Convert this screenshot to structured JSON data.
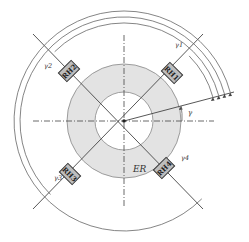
{
  "diagram": {
    "colors": {
      "line": "#444444",
      "ring_fill": "#e3e3e3",
      "box_fill": "#bdbdbd",
      "box_stroke": "#333333",
      "arc": "#666666"
    },
    "center": [
      124,
      121
    ],
    "ring": {
      "inner_radius": 29,
      "outer_radius": 57,
      "label": "ER"
    },
    "reference_angle_label": "γ",
    "heaters": [
      {
        "label": "RH1",
        "angle_deg": 45
      },
      {
        "label": "RH2",
        "angle_deg": 135
      },
      {
        "label": "RH3",
        "angle_deg": 225
      },
      {
        "label": "RH4",
        "angle_deg": 315
      }
    ],
    "arcs": [
      {
        "label": "γ1",
        "radius": 92,
        "end_deg": 45
      },
      {
        "label": "γ2",
        "radius": 98,
        "end_deg": 135
      },
      {
        "label": "γ3",
        "radius": 104,
        "end_deg": 225
      },
      {
        "label": "γ4",
        "radius": 110,
        "end_deg": 315
      }
    ],
    "start_ray_deg": 15
  }
}
